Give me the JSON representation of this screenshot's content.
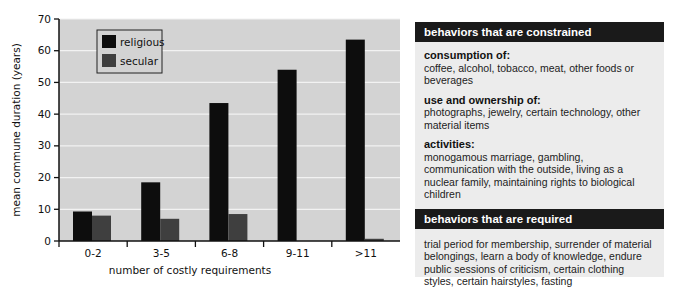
{
  "chart_data": {
    "type": "bar",
    "title": "",
    "xlabel": "number of costly requirements",
    "ylabel": "mean commune duration (years)",
    "ylim": [
      0,
      70
    ],
    "yticks": [
      0,
      10,
      20,
      30,
      40,
      50,
      60,
      70
    ],
    "grid": true,
    "legend_position": "upper left (inside plot)",
    "categories": [
      "0-2",
      "3-5",
      "6-8",
      "9-11",
      ">11"
    ],
    "series": [
      {
        "name": "religious",
        "color": "#0d0d0d",
        "values": [
          9.3,
          18.5,
          43.5,
          54,
          63.5
        ]
      },
      {
        "name": "secular",
        "color": "#3f3f3f",
        "values": [
          8,
          7,
          8.5,
          null,
          0.7
        ]
      }
    ]
  },
  "panel": {
    "constrained_header": "behaviors that are constrained",
    "constrained_sections": [
      {
        "title": "consumption of:",
        "text": "coffee, alcohol, tobacco, meat, other foods or beverages"
      },
      {
        "title": "use and ownership of:",
        "text": "photographs, jewelry, certain technology, other material items"
      },
      {
        "title": "activities:",
        "text": "monogamous marriage, gambling, communication with the outside, living as a nuclear family, maintaining rights to biological children"
      }
    ],
    "required_header": "behaviors that are required",
    "required_text": "trial period for membership, surrender of material belongings, learn a body of knowledge, endure public sessions of criticism, certain clothing styles, certain hairstyles, fasting"
  }
}
